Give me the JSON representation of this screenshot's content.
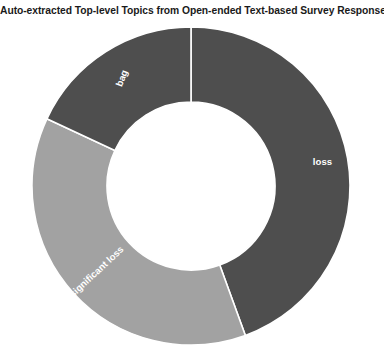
{
  "chart_data": {
    "type": "pie",
    "variant": "donut",
    "title": "Auto-extracted Top-level Topics from Open-ended Text-based Survey Responses",
    "xlabel": "",
    "ylabel": "",
    "legend": "none",
    "grid": false,
    "labels_inside_slices": true,
    "start_angle_deg": 0,
    "direction": "clockwise",
    "inner_radius_ratio": 0.53,
    "categories": [
      "loss",
      "significant loss",
      "bag"
    ],
    "values": [
      44.4,
      37.5,
      18.1
    ],
    "slices": [
      {
        "label": "loss",
        "value": 44.4,
        "start_angle_deg": 0,
        "end_angle_deg": 160,
        "color": "#4e4e4e",
        "label_rotation_deg": 0
      },
      {
        "label": "significant loss",
        "value": 37.5,
        "start_angle_deg": 160,
        "end_angle_deg": 295,
        "color": "#a2a2a2",
        "label_rotation_deg": -43
      },
      {
        "label": "bag",
        "value": 18.1,
        "start_angle_deg": 295,
        "end_angle_deg": 360,
        "color": "#4e4e4e",
        "label_rotation_deg": -69
      }
    ]
  },
  "figure": {
    "background_color": "#ffffff",
    "title_color": "#1a1a1a",
    "slice_divider_color": "#ffffff",
    "slice_label_color": "#ffffff",
    "center_x": 191,
    "center_y": 186,
    "outer_radius": 159,
    "inner_radius": 84
  }
}
